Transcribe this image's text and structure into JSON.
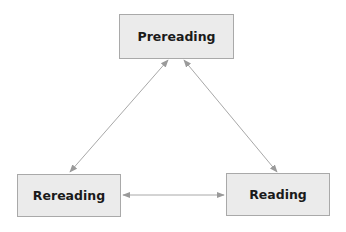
{
  "diagram": {
    "nodes": [
      {
        "id": "prereading",
        "label": "Prereading"
      },
      {
        "id": "rereading",
        "label": "Rereading"
      },
      {
        "id": "reading",
        "label": "Reading"
      }
    ],
    "edges": [
      {
        "from": "prereading",
        "to": "rereading",
        "direction": "both"
      },
      {
        "from": "prereading",
        "to": "reading",
        "direction": "both"
      },
      {
        "from": "rereading",
        "to": "reading",
        "direction": "both"
      }
    ],
    "colors": {
      "node_fill": "#ebebeb",
      "node_border": "#a9a9a9",
      "arrow": "#9a9a9a"
    }
  }
}
